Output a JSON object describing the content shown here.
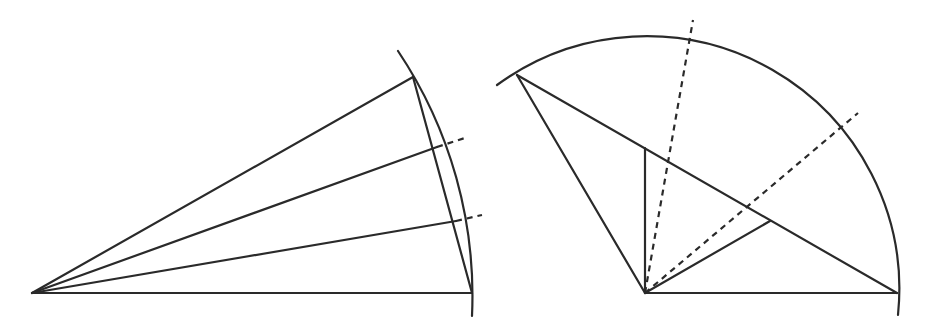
{
  "diagram": {
    "colors": {
      "stroke": "#2a2a2a",
      "background": "#ffffff"
    },
    "left_figure": {
      "apex": [
        32,
        293
      ],
      "radius": 440,
      "base_end": [
        472,
        293
      ],
      "top_point": [
        413,
        77
      ],
      "arc": {
        "start": [
          398,
          51
        ],
        "end": [
          472,
          316
        ]
      },
      "rays": [
        {
          "to": [
            437,
            147
          ],
          "dashed_to": [
            468,
            137
          ]
        },
        {
          "to": [
            456,
            221
          ],
          "dashed_to": [
            482,
            215
          ]
        }
      ],
      "chord": {
        "from": [
          413,
          77
        ],
        "to": [
          472,
          293
        ]
      }
    },
    "right_figure": {
      "center": [
        645,
        293
      ],
      "radius": 252,
      "base_end": [
        897,
        293
      ],
      "top_left_point": [
        517,
        75
      ],
      "arc": {
        "start": [
          497,
          85
        ],
        "end": [
          898,
          315
        ]
      },
      "chord": {
        "from": [
          517,
          75
        ],
        "to": [
          897,
          293
        ]
      },
      "vertical_segment": {
        "from": [
          645,
          293
        ],
        "to": [
          645,
          148
        ]
      },
      "inner_segment": {
        "from": [
          645,
          293
        ],
        "to": [
          770,
          221
        ]
      },
      "dashed_lines": [
        {
          "from": [
            645,
            293
          ],
          "to": [
            693,
            20
          ]
        },
        {
          "from": [
            645,
            293
          ],
          "to": [
            858,
            113
          ]
        }
      ]
    }
  }
}
